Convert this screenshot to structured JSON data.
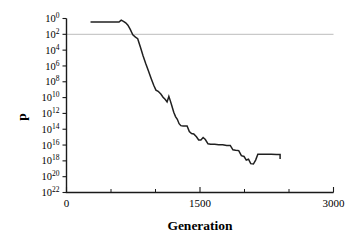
{
  "chart_data": {
    "type": "line",
    "title": "",
    "xlabel": "Generation",
    "ylabel": "p",
    "xlim": [
      0,
      3000
    ],
    "ylim_log10": [
      -22,
      0
    ],
    "yscale": "log",
    "grid": false,
    "legend": null,
    "x_ticks_major": [
      0,
      1500,
      3000
    ],
    "x_tick_labels": [
      "0",
      "1500",
      "3000"
    ],
    "x_ticks_minor": [
      500,
      1000,
      2000,
      2500
    ],
    "y_tick_exponents": [
      0,
      -2,
      -4,
      -6,
      -8,
      -10,
      -12,
      -14,
      -16,
      -18,
      -20,
      -22
    ],
    "y_tick_labels": [
      "10^0",
      "10^-2",
      "10^-4",
      "10^-6",
      "10^-8",
      "10^-10",
      "10^-12",
      "10^-14",
      "10^-16",
      "10^-18",
      "10^-20",
      "10^-22"
    ],
    "y_tick_mantissa": "10",
    "y_tick_exponent_text": [
      "0",
      "2",
      "4",
      "6",
      "8",
      "10",
      "12",
      "14",
      "16",
      "18",
      "20",
      "22"
    ],
    "annotations": [
      {
        "name": "significance-threshold",
        "type": "hline",
        "y_log10": -2,
        "label": "",
        "color": "#c9c9c9",
        "x_start": 0,
        "x_end": 3000
      }
    ],
    "series": [
      {
        "name": "p-value",
        "color": "#202020",
        "points": [
          [
            270,
            -0.45
          ],
          [
            330,
            -0.45
          ],
          [
            400,
            -0.45
          ],
          [
            470,
            -0.45
          ],
          [
            545,
            -0.45
          ],
          [
            590,
            -0.45
          ],
          [
            615,
            -0.2
          ],
          [
            640,
            -0.35
          ],
          [
            665,
            -0.55
          ],
          [
            690,
            -0.85
          ],
          [
            715,
            -1.35
          ],
          [
            745,
            -2.05
          ],
          [
            775,
            -2.35
          ],
          [
            800,
            -2.55
          ],
          [
            830,
            -3.6
          ],
          [
            860,
            -4.7
          ],
          [
            890,
            -5.7
          ],
          [
            920,
            -6.6
          ],
          [
            950,
            -7.55
          ],
          [
            980,
            -8.45
          ],
          [
            1005,
            -9.05
          ],
          [
            1030,
            -9.2
          ],
          [
            1060,
            -9.55
          ],
          [
            1085,
            -9.95
          ],
          [
            1110,
            -10.25
          ],
          [
            1130,
            -10.55
          ],
          [
            1150,
            -9.85
          ],
          [
            1165,
            -10.35
          ],
          [
            1185,
            -11.1
          ],
          [
            1205,
            -11.85
          ],
          [
            1225,
            -12.4
          ],
          [
            1245,
            -12.75
          ],
          [
            1265,
            -13.3
          ],
          [
            1285,
            -13.55
          ],
          [
            1310,
            -13.6
          ],
          [
            1355,
            -13.6
          ],
          [
            1380,
            -14.3
          ],
          [
            1405,
            -14.55
          ],
          [
            1430,
            -14.6
          ],
          [
            1460,
            -14.95
          ],
          [
            1485,
            -15.35
          ],
          [
            1510,
            -15.35
          ],
          [
            1535,
            -15.05
          ],
          [
            1560,
            -15.3
          ],
          [
            1590,
            -15.85
          ],
          [
            1620,
            -15.9
          ],
          [
            1665,
            -15.9
          ],
          [
            1710,
            -15.95
          ],
          [
            1755,
            -15.95
          ],
          [
            1800,
            -16.05
          ],
          [
            1840,
            -16.05
          ],
          [
            1870,
            -16.6
          ],
          [
            1900,
            -16.65
          ],
          [
            1935,
            -16.7
          ],
          [
            1965,
            -17.35
          ],
          [
            1995,
            -17.45
          ],
          [
            2020,
            -17.9
          ],
          [
            2045,
            -17.8
          ],
          [
            2070,
            -18.35
          ],
          [
            2100,
            -18.4
          ],
          [
            2125,
            -17.9
          ],
          [
            2150,
            -17.15
          ],
          [
            2185,
            -17.15
          ],
          [
            2240,
            -17.15
          ],
          [
            2300,
            -17.15
          ],
          [
            2360,
            -17.2
          ],
          [
            2400,
            -17.2
          ],
          [
            2400,
            -17.75
          ]
        ]
      }
    ]
  }
}
